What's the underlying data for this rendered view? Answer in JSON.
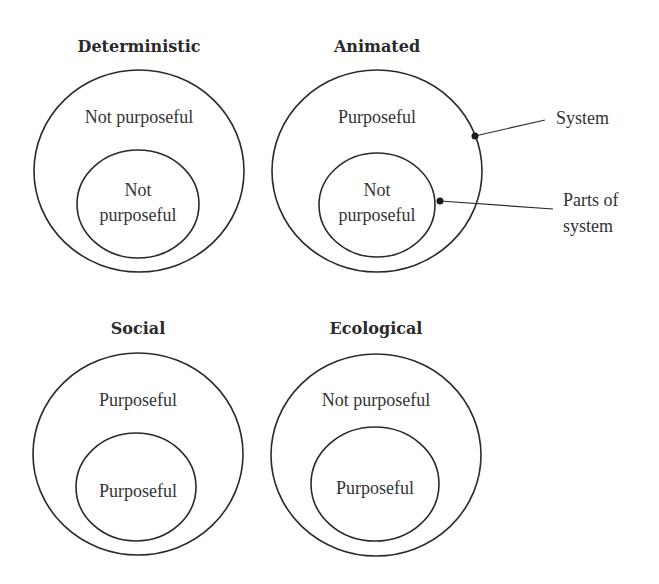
{
  "diagram": {
    "panels": [
      {
        "title": "Deterministic",
        "system_label": "Not purposeful",
        "parts_label_line1": "Not",
        "parts_label_line2": "purposeful"
      },
      {
        "title": "Animated",
        "system_label": "Purposeful",
        "parts_label_line1": "Not",
        "parts_label_line2": "purposeful"
      },
      {
        "title": "Social",
        "system_label": "Purposeful",
        "parts_label": "Purposeful"
      },
      {
        "title": "Ecological",
        "system_label": "Not purposeful",
        "parts_label": "Purposeful"
      }
    ],
    "callouts": {
      "system": "System",
      "parts_line1": "Parts of",
      "parts_line2": "system"
    }
  }
}
